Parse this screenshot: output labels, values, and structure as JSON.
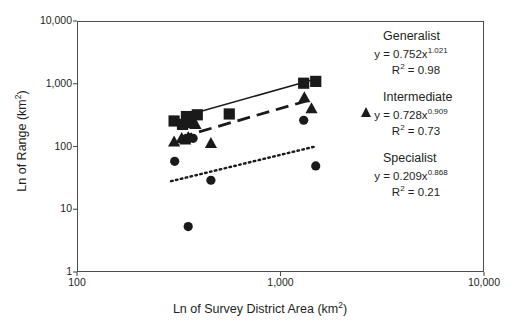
{
  "chart_data": {
    "type": "scatter",
    "title": "",
    "xlabel": "Ln of Survey District Area (km2)",
    "ylabel": "Ln of Range (km2)",
    "xscale": "log",
    "yscale": "log",
    "xlim": [
      100,
      10000
    ],
    "ylim": [
      1,
      10000
    ],
    "xticks": [
      "100",
      "1,000",
      "10,000"
    ],
    "xtick_values": [
      100,
      1000,
      10000
    ],
    "yticks": [
      "1",
      "10",
      "100",
      "1,000",
      "10,000"
    ],
    "ytick_values": [
      1,
      10,
      100,
      1000,
      10000
    ],
    "grid": false,
    "legend_position": "right",
    "series": [
      {
        "name": "Generalist",
        "marker": "square",
        "color": "#1a1a1a",
        "equation": "y = 0.752x",
        "exponent": "1.021",
        "r2_label": "R",
        "r2_value": "= 0.98",
        "fit_line_style": "solid",
        "points": [
          {
            "x": 300,
            "y": 255
          },
          {
            "x": 330,
            "y": 225
          },
          {
            "x": 345,
            "y": 300
          },
          {
            "x": 360,
            "y": 240
          },
          {
            "x": 390,
            "y": 320
          },
          {
            "x": 560,
            "y": 330
          },
          {
            "x": 1300,
            "y": 1020
          },
          {
            "x": 1490,
            "y": 1090
          }
        ],
        "fit_x": [
          330,
          1430
        ],
        "fit_y": [
          300,
          1150
        ]
      },
      {
        "name": "Intermediate",
        "marker": "triangle",
        "color": "#1a1a1a",
        "equation": "y = 0.728x",
        "exponent": "0.909",
        "r2_label": "R",
        "r2_value": "= 0.73",
        "fit_line_style": "dashed",
        "points": [
          {
            "x": 300,
            "y": 118
          },
          {
            "x": 327,
            "y": 135
          },
          {
            "x": 340,
            "y": 128
          },
          {
            "x": 352,
            "y": 140
          },
          {
            "x": 370,
            "y": 260
          },
          {
            "x": 382,
            "y": 225
          },
          {
            "x": 455,
            "y": 112
          },
          {
            "x": 1310,
            "y": 600
          },
          {
            "x": 1420,
            "y": 400
          }
        ],
        "fit_x": [
          320,
          1420
        ],
        "fit_y": [
          140,
          560
        ]
      },
      {
        "name": "Specialist",
        "marker": "circle",
        "color": "#1a1a1a",
        "equation": "y = 0.209x",
        "exponent": "0.868",
        "r2_label": "R",
        "r2_value": "= 0.21",
        "fit_line_style": "dotted",
        "points": [
          {
            "x": 302,
            "y": 58
          },
          {
            "x": 350,
            "y": 130
          },
          {
            "x": 372,
            "y": 135
          },
          {
            "x": 352,
            "y": 5.3
          },
          {
            "x": 455,
            "y": 29
          },
          {
            "x": 1300,
            "y": 262
          },
          {
            "x": 1490,
            "y": 49
          }
        ],
        "fit_x": [
          290,
          1480
        ],
        "fit_y": [
          28,
          100
        ]
      }
    ]
  },
  "axes": {
    "x_title_main": "Ln of Survey District Area (km",
    "x_title_sup": "2",
    "x_title_end": ")",
    "y_title_main": "Ln of Range (km",
    "y_title_sup": "2",
    "y_title_end": ")"
  }
}
